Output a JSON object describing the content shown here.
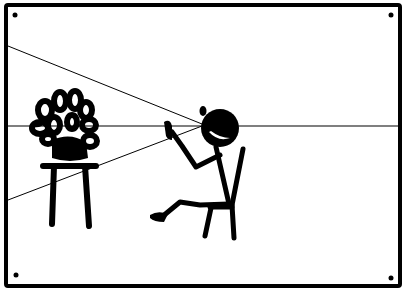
{
  "illustration": {
    "style": "hand-drawn stick-figure comic panel",
    "subject": "stick figure seated in a chair gazing at a potted plant on a stool, with perspective sight lines",
    "elements": [
      "panel-frame",
      "corner-dots",
      "horizon-line",
      "sight-line-upper",
      "sight-line-lower",
      "plant",
      "stool",
      "stick-figure",
      "chair"
    ],
    "colors": {
      "ink": "#000000",
      "paper": "#ffffff"
    }
  }
}
